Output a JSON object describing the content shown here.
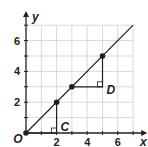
{
  "chart_data": {
    "type": "line",
    "title": "",
    "xlabel": "x",
    "ylabel": "y",
    "origin_label": "O",
    "xlim": [
      0,
      7
    ],
    "ylim": [
      0,
      7
    ],
    "grid": true,
    "x_ticks": [
      2,
      4,
      6
    ],
    "y_ticks": [
      2,
      4,
      6
    ],
    "x_tick_labels": [
      "2",
      "4",
      "6"
    ],
    "y_tick_labels": [
      "2",
      "4",
      "6"
    ],
    "line": {
      "from": [
        0,
        0
      ],
      "to": [
        7,
        7
      ],
      "slope": 1
    },
    "points": [
      {
        "x": 0,
        "y": 0
      },
      {
        "x": 2,
        "y": 2
      },
      {
        "x": 3,
        "y": 3
      },
      {
        "x": 5,
        "y": 5
      }
    ],
    "triangles": [
      {
        "label": "C",
        "vertices": [
          [
            0,
            0
          ],
          [
            2,
            0
          ],
          [
            2,
            2
          ]
        ],
        "right_angle_at": [
          2,
          0
        ]
      },
      {
        "label": "D",
        "vertices": [
          [
            3,
            3
          ],
          [
            5,
            3
          ],
          [
            5,
            5
          ]
        ],
        "right_angle_at": [
          5,
          3
        ]
      }
    ],
    "colors": {
      "grid": "#d9d9d9",
      "ink": "#231f20"
    }
  }
}
